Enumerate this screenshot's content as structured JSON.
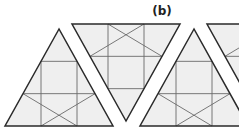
{
  "figure": {
    "label": "(b)",
    "label_pos": [
      162,
      15
    ],
    "colors": {
      "fill": "#efefef",
      "outer_stroke": "#2a2a2a",
      "inner_stroke": "#6a6a6a",
      "background": "#ffffff"
    },
    "subdivisions": 3,
    "triangles": [
      {
        "orientation": "up",
        "apex": [
          59,
          29
        ],
        "base_left": [
          5,
          126
        ],
        "base_right": [
          113,
          126
        ]
      },
      {
        "orientation": "down",
        "apex": [
          126,
          121
        ],
        "base_left": [
          72,
          24
        ],
        "base_right": [
          180,
          24
        ]
      },
      {
        "orientation": "up",
        "apex": [
          194,
          29
        ],
        "base_left": [
          140,
          126
        ],
        "base_right": [
          248,
          126
        ]
      },
      {
        "orientation": "down",
        "apex": [
          261,
          121
        ],
        "base_left": [
          207,
          24
        ],
        "base_right": [
          315,
          24
        ]
      }
    ]
  }
}
